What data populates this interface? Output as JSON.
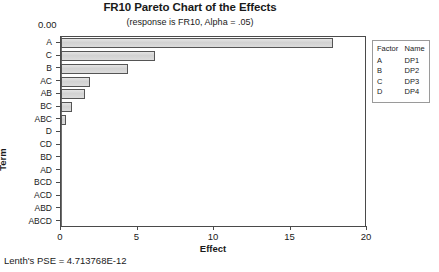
{
  "chart_data": {
    "type": "bar",
    "orientation": "horizontal",
    "title": "FR10 Pareto Chart of the Effects",
    "subtitle": "(response is FR10, Alpha = .05)",
    "xlabel": "Effect",
    "ylabel": "Term",
    "xlim": [
      0,
      20
    ],
    "xticks": [
      0,
      5,
      10,
      15,
      20
    ],
    "xtick_labels": [
      "0",
      "5",
      "10",
      "15",
      "20"
    ],
    "grid": false,
    "categories": [
      "A",
      "C",
      "B",
      "AC",
      "AB",
      "BC",
      "ABC",
      "D",
      "CD",
      "BD",
      "AD",
      "BCD",
      "ACD",
      "ABD",
      "ABCD"
    ],
    "values": [
      17.8,
      6.15,
      4.4,
      1.9,
      1.55,
      0.75,
      0.35,
      0,
      0,
      0,
      0,
      0,
      0,
      0,
      0
    ],
    "reference_line": {
      "label": "0.00",
      "value": 0
    },
    "legend": {
      "position": "right",
      "headers": [
        "Factor",
        "Name"
      ],
      "rows": [
        {
          "factor": "A",
          "name": "DP1"
        },
        {
          "factor": "B",
          "name": "DP2"
        },
        {
          "factor": "C",
          "name": "DP3"
        },
        {
          "factor": "D",
          "name": "DP4"
        }
      ]
    },
    "annotations": [
      "Lenth's PSE = 4.713768E-12"
    ]
  },
  "footnote": "Lenth's PSE = 4.713768E-12",
  "colors": {
    "bar_fill": "#d6d6d6",
    "bar_border": "#555555",
    "axis": "#4a4a4a",
    "text": "#1a1a1a"
  }
}
